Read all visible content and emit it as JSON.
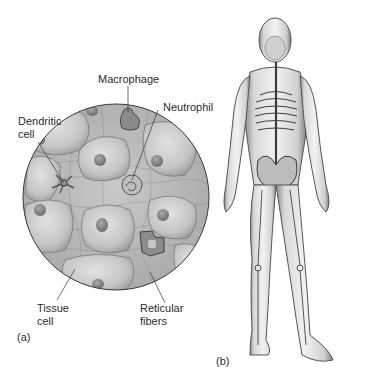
{
  "panel_a": {
    "panel_label": "(a)",
    "labels": {
      "macrophage": "Macrophage",
      "neutrophil": "Neutrophil",
      "dendritic_line1": "Dendritic",
      "dendritic_line2": "cell",
      "tissue_line1": "Tissue",
      "tissue_line2": "cell",
      "reticular_line1": "Reticular",
      "reticular_line2": "fibers"
    }
  },
  "panel_b": {
    "panel_label": "(b)"
  }
}
